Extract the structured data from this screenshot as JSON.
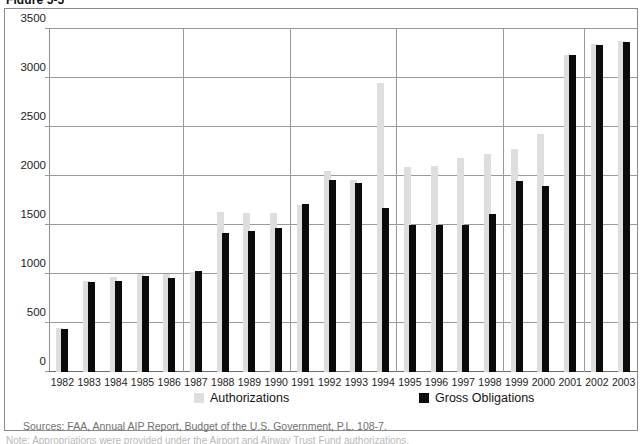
{
  "figure": {
    "title": "Figure 5-5"
  },
  "legend": {
    "position": "bottom-inside",
    "entries": [
      {
        "label": "Authorizations",
        "swatch": "light-gray-square",
        "color": "#dedede"
      },
      {
        "label": "Gross Obligations",
        "swatch": "black-square",
        "color": "#0b0b0b"
      }
    ]
  },
  "sources": {
    "text": "Sources: FAA, Annual AIP Report, Budget of the U.S. Government, P.L. 108-7."
  },
  "footnote": {
    "text": "Note: Appropriations were provided under the Airport and Airway Trust Fund authorizations."
  },
  "chart_data": {
    "type": "bar",
    "title": "Figure 5-5",
    "subtitle": "",
    "xlabel": "",
    "ylabel": "",
    "ylim": [
      0,
      3500
    ],
    "ytick_step": 500,
    "yticks": [
      "0",
      "500",
      "1000",
      "1500",
      "2000",
      "2500",
      "3000",
      "3500"
    ],
    "grid": "horizontal-gridlines-plus-sparse-vertical",
    "vertical_gridline_after_categories": [
      "1986",
      "1990",
      "1994",
      "1998",
      "2001"
    ],
    "categories": [
      "1982",
      "1983",
      "1984",
      "1985",
      "1986",
      "1987",
      "1988",
      "1989",
      "1990",
      "1991",
      "1992",
      "1993",
      "1994",
      "1995",
      "1996",
      "1997",
      "1998",
      "1999",
      "2000",
      "2001",
      "2002",
      "2003"
    ],
    "series": [
      {
        "name": "Authorizations",
        "color": "#dedede",
        "values": [
          450,
          930,
          965,
          1000,
          1000,
          1020,
          1630,
          1620,
          1620,
          1700,
          2050,
          1960,
          2950,
          2090,
          2100,
          2180,
          2220,
          2280,
          2430,
          3230,
          3350,
          3380
        ]
      },
      {
        "name": "Gross Obligations",
        "color": "#0b0b0b",
        "values": [
          440,
          920,
          930,
          975,
          955,
          1035,
          1415,
          1440,
          1470,
          1710,
          1955,
          1930,
          1670,
          1500,
          1500,
          1500,
          1615,
          1945,
          1895,
          3230,
          3340,
          3370
        ]
      }
    ]
  }
}
